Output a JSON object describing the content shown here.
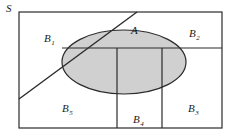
{
  "figure": {
    "type": "venn-partition-diagram",
    "background_color": "#ffffff",
    "stroke_color": "#2b2b2b",
    "ellipse_fill_color": "#d0d0d0"
  },
  "labels": {
    "sample_space": {
      "text": "S",
      "subscript": ""
    },
    "event_a": {
      "text": "A",
      "subscript": ""
    },
    "b1": {
      "text": "B",
      "subscript": "1"
    },
    "b2": {
      "text": "B",
      "subscript": "2"
    },
    "b3": {
      "text": "B",
      "subscript": "3"
    },
    "b4": {
      "text": "B",
      "subscript": "4"
    },
    "b5": {
      "text": "B",
      "subscript": "5"
    }
  },
  "geometry": {
    "outer_rect": {
      "x": 19,
      "y": 12,
      "width": 203,
      "height": 116
    },
    "ellipse": {
      "cx": 124,
      "cy": 62,
      "rx": 62,
      "ry": 32
    },
    "diagonal_line": {
      "x1": 19,
      "y1": 99,
      "x2": 137,
      "y2": 12
    },
    "horizontal_divider": {
      "x1": 62,
      "y1": 48,
      "x2": 222,
      "y2": 48
    },
    "vertical_divider_left": {
      "x": 117,
      "y1": 48,
      "y2": 128
    },
    "vertical_divider_right": {
      "x": 162,
      "y1": 48,
      "y2": 128
    }
  }
}
